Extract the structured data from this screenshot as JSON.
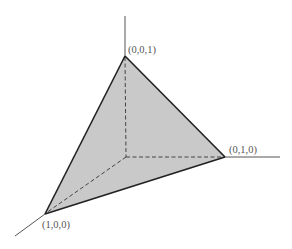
{
  "diagram": {
    "colors": {
      "face_fill": "#c9c9c9",
      "edge": "#222222",
      "axis": "#555555",
      "hidden": "#444444",
      "label": "#555555"
    },
    "points": {
      "origin": [
        126,
        157
      ],
      "x_axis_end": [
        15,
        236
      ],
      "y_axis_end": [
        280,
        157
      ],
      "z_axis_end": [
        125,
        16
      ],
      "v100": [
        45,
        214
      ],
      "v010": [
        225,
        157
      ],
      "v001": [
        125,
        56
      ]
    },
    "labels": {
      "v001": "(0,0,1)",
      "v010": "(0,1,0)",
      "v100": "(1,0,0)"
    }
  }
}
